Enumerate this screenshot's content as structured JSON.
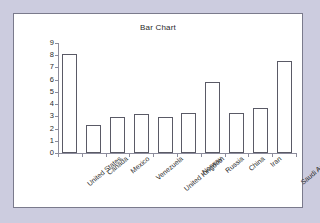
{
  "page": {
    "background_color": "#ccccdf",
    "panel_background": "#ffffff",
    "panel_border_color": "#7a7a8c"
  },
  "chart_data": {
    "type": "bar",
    "title": "Bar Chart",
    "xlabel": "",
    "ylabel": "",
    "ylim": [
      0,
      9
    ],
    "grid": false,
    "legend": null,
    "bar_fill_color": "#ffffff",
    "bar_edge_color": "#5a5a66",
    "axis_color": "#8c8c9c",
    "yticks": [
      0,
      1,
      2,
      3,
      4,
      5,
      6,
      7,
      8,
      9
    ],
    "ytick_labels": [
      "0",
      "1",
      "2",
      "3",
      "4",
      "5",
      "6",
      "7",
      "8",
      "9"
    ],
    "categories": [
      "United States",
      "Canada",
      "Mexico",
      "Venezuela",
      "United Kingdom",
      "Norway",
      "Russia",
      "China",
      "Iran",
      "Saudi Arabia"
    ],
    "values": [
      8.1,
      2.3,
      2.95,
      3.2,
      2.95,
      3.3,
      5.85,
      3.25,
      3.7,
      7.5
    ]
  }
}
